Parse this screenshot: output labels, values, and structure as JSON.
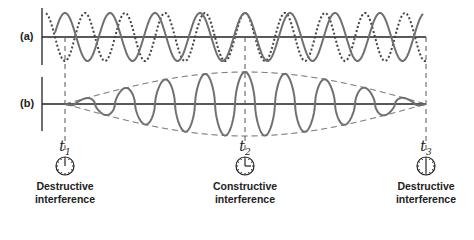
{
  "panels": {
    "a": {
      "label": "(a)",
      "description": "Two waves of slightly different frequency superposed"
    },
    "b": {
      "label": "(b)",
      "description": "Resultant beat wave with amplitude envelope"
    }
  },
  "markers": [
    {
      "id": "t1",
      "symbol": "t",
      "subscript": "1",
      "caption_line1": "Destructive",
      "caption_line2": "interference",
      "clock": "twelve"
    },
    {
      "id": "t2",
      "symbol": "t",
      "subscript": "2",
      "caption_line1": "Constructive",
      "caption_line2": "interference",
      "clock": "three"
    },
    {
      "id": "t3",
      "symbol": "t",
      "subscript": "3",
      "caption_line1": "Destructive",
      "caption_line2": "interference",
      "clock": "six"
    }
  ],
  "colors": {
    "wave_solid": "#707070",
    "wave_dotted": "#444444",
    "axis": "#222222",
    "dashed": "#555555"
  },
  "geometry": {
    "axis_x": 42,
    "a_axis_y": 37,
    "b_axis_y": 104,
    "t_x": [
      65,
      245,
      426
    ],
    "solid_period": 45,
    "dotted_period": 40,
    "a_amplitude": 24,
    "b_max_amplitude": 32
  }
}
